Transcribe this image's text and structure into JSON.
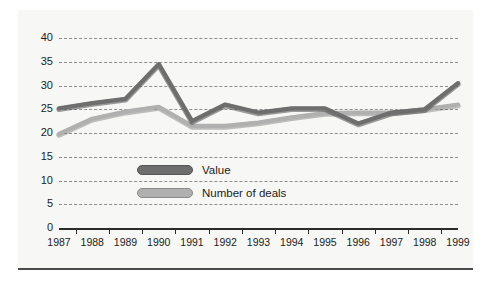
{
  "chart_data": {
    "type": "line",
    "title": "",
    "xlabel": "",
    "ylabel": "",
    "ylim": [
      0,
      40
    ],
    "ytick_step": 5,
    "yticks": [
      40,
      35,
      30,
      25,
      20,
      15,
      10,
      5,
      0
    ],
    "grid": true,
    "legend_position": "inside-center",
    "categories": [
      "1987",
      "1988",
      "1989",
      "1990",
      "1991",
      "1992",
      "1993",
      "1994",
      "1995",
      "1996",
      "1997",
      "1998",
      "1999"
    ],
    "series": [
      {
        "name": "Value",
        "color": "#6e6e6e",
        "values": [
          25.2,
          26.3,
          27.2,
          34.5,
          22.5,
          26.0,
          24.3,
          25.2,
          25.2,
          22.0,
          24.3,
          25.0,
          30.5
        ]
      },
      {
        "name": "Number of deals",
        "color": "#b0b0b0",
        "values": [
          19.8,
          23.0,
          24.5,
          25.5,
          21.5,
          21.5,
          22.2,
          23.3,
          24.2,
          24.3,
          24.3,
          25.0,
          26.0
        ]
      }
    ]
  },
  "legend": {
    "items": [
      {
        "label": "Value",
        "color": "#6e6e6e"
      },
      {
        "label": "Number of deals",
        "color": "#b0b0b0"
      }
    ]
  },
  "colors": {
    "background": "#f7f7f5",
    "page": "#ffffff",
    "rule": "#4a4a4a",
    "axis": "#2b2b2b",
    "grid": "#8e8e8e",
    "value_series": "#6e6e6e",
    "deals_series": "#b0b0b0",
    "text": "#1c1c1c"
  }
}
